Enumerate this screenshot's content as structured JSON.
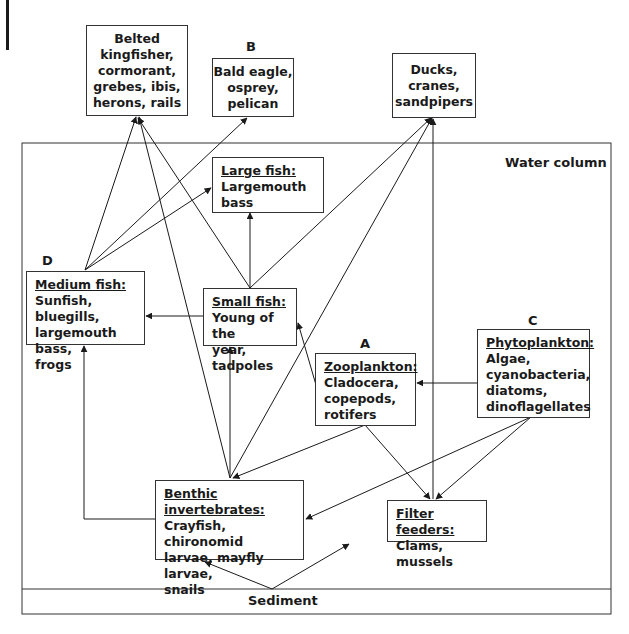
{
  "header": {
    "text": "Use the information in the diagram to answer the questions that follow."
  },
  "regions": {
    "water_column": "Water column",
    "sediment": "Sediment"
  },
  "letters": {
    "a": "A",
    "b": "B",
    "c": "C",
    "d": "D"
  },
  "nodes": {
    "birds_fish_eaters": {
      "title": "",
      "body": "Belted\nkingfisher,\ncormorant,\ngrebes, ibis,\nherons, rails"
    },
    "raptors": {
      "title": "",
      "body": "Bald eagle,\nosprey,\npelican"
    },
    "waders": {
      "title": "",
      "body": "Ducks,\ncranes,\nsandpipers"
    },
    "large_fish": {
      "title": "Large fish:",
      "body": "Largemouth bass"
    },
    "medium_fish": {
      "title": "Medium fish:",
      "body": "Sunfish, bluegills,\nlargemouth bass,\nfrogs"
    },
    "small_fish": {
      "title": "Small fish:",
      "body": "Young of the\nyear, tadpoles"
    },
    "zooplankton": {
      "title": "Zooplankton:",
      "body": "Cladocera,\ncopepods,\nrotifers"
    },
    "phytoplankton": {
      "title": "Phytoplankton:",
      "body": "Algae,\ncyanobacteria,\ndiatoms,\ndinoflagellates"
    },
    "benthic": {
      "title": "Benthic invertebrates:",
      "body": "Crayfish, chironomid\nlarvae, mayfly larvae,\nsnails"
    },
    "filter_feeders": {
      "title": "Filter feeders:",
      "body": "Clams, mussels"
    }
  },
  "edges": [
    {
      "from": "medium_fish",
      "to": "birds_fish_eaters"
    },
    {
      "from": "medium_fish",
      "to": "raptors"
    },
    {
      "from": "medium_fish",
      "to": "large_fish"
    },
    {
      "from": "small_fish",
      "to": "birds_fish_eaters"
    },
    {
      "from": "small_fish",
      "to": "large_fish"
    },
    {
      "from": "small_fish",
      "to": "medium_fish"
    },
    {
      "from": "small_fish",
      "to": "waders"
    },
    {
      "from": "benthic",
      "to": "birds_fish_eaters"
    },
    {
      "from": "benthic",
      "to": "waders"
    },
    {
      "from": "benthic",
      "to": "small_fish"
    },
    {
      "from": "benthic",
      "to": "medium_fish"
    },
    {
      "from": "zooplankton",
      "to": "small_fish"
    },
    {
      "from": "zooplankton",
      "to": "benthic"
    },
    {
      "from": "zooplankton",
      "to": "filter_feeders"
    },
    {
      "from": "phytoplankton",
      "to": "zooplankton"
    },
    {
      "from": "phytoplankton",
      "to": "benthic"
    },
    {
      "from": "phytoplankton",
      "to": "filter_feeders"
    },
    {
      "from": "filter_feeders",
      "to": "waders"
    },
    {
      "from": "sediment",
      "to": "benthic"
    },
    {
      "from": "sediment",
      "to": "filter_feeders"
    }
  ]
}
